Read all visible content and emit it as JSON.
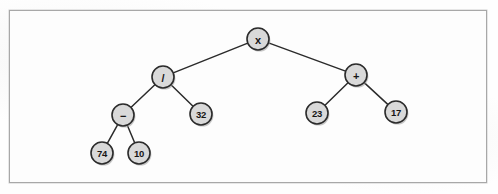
{
  "figure": {
    "background_color": "#fdfdfd",
    "frame_color": "#a8a8a8",
    "node_fill": "#d9d9d9",
    "node_stroke": "#2b2b2b",
    "edge_color": "#2b2b2b"
  },
  "tree": {
    "node_radius": 11,
    "nodes": [
      {
        "id": "root",
        "label": "x",
        "kind": "operator",
        "x": 258,
        "y": 39
      },
      {
        "id": "div",
        "label": "/",
        "kind": "operator",
        "x": 163,
        "y": 77
      },
      {
        "id": "plus",
        "label": "+",
        "kind": "operator",
        "x": 356,
        "y": 75
      },
      {
        "id": "minus",
        "label": "−",
        "kind": "operator",
        "x": 123,
        "y": 115
      },
      {
        "id": "n32",
        "label": "32",
        "kind": "operand",
        "x": 201,
        "y": 114
      },
      {
        "id": "n23",
        "label": "23",
        "kind": "operand",
        "x": 317,
        "y": 113
      },
      {
        "id": "n17",
        "label": "17",
        "kind": "operand",
        "x": 396,
        "y": 112
      },
      {
        "id": "n74",
        "label": "74",
        "kind": "operand",
        "x": 102,
        "y": 153
      },
      {
        "id": "n10",
        "label": "10",
        "kind": "operand",
        "x": 139,
        "y": 153
      }
    ],
    "edges": [
      {
        "from": "root",
        "to": "div"
      },
      {
        "from": "root",
        "to": "plus"
      },
      {
        "from": "div",
        "to": "minus"
      },
      {
        "from": "div",
        "to": "n32"
      },
      {
        "from": "plus",
        "to": "n23"
      },
      {
        "from": "plus",
        "to": "n17"
      },
      {
        "from": "minus",
        "to": "n74"
      },
      {
        "from": "minus",
        "to": "n10"
      }
    ]
  }
}
